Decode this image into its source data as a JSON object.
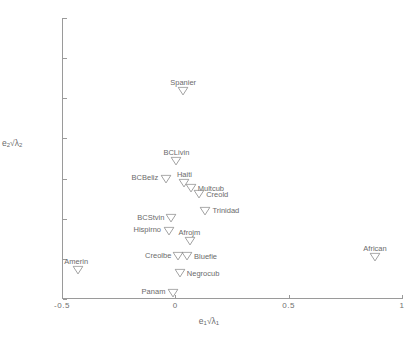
{
  "chart_data": {
    "type": "scatter",
    "title": "",
    "xlabel": "e1 sqrt(lambda1)",
    "ylabel": "e2 sqrt(lambda2)",
    "xlim": [
      -0.5,
      1.0
    ],
    "ylim": [
      -0.4,
      1.0
    ],
    "grid": false,
    "legend": null,
    "marker": "down-triangle-open",
    "xticks": [
      "-0.5",
      "0",
      "0.5",
      "1"
    ],
    "xtick_values": [
      -0.5,
      0,
      0.5,
      1
    ],
    "yticks": [
      "1",
      "0.8",
      "0.6",
      "0.4",
      "0.2",
      "0",
      "-0.2",
      "-0.4"
    ],
    "ytick_values": [
      1,
      0.8,
      0.6,
      0.4,
      0.2,
      0,
      -0.2,
      -0.4
    ],
    "points": [
      {
        "label": "Spanier",
        "x": 0.035,
        "y": 0.635,
        "label_pos": "above"
      },
      {
        "label": "BCLivin",
        "x": 0.005,
        "y": 0.288,
        "label_pos": "above"
      },
      {
        "label": "BCBeliz",
        "x": -0.043,
        "y": 0.198,
        "label_pos": "left"
      },
      {
        "label": "Haiti",
        "x": 0.04,
        "y": 0.178,
        "label_pos": "above"
      },
      {
        "label": "Multcub",
        "x": 0.068,
        "y": 0.152,
        "label_pos": "right"
      },
      {
        "label": "Creold",
        "x": 0.105,
        "y": 0.122,
        "label_pos": "right"
      },
      {
        "label": "Trinidad",
        "x": 0.133,
        "y": 0.04,
        "label_pos": "right"
      },
      {
        "label": "BCStvin",
        "x": -0.018,
        "y": 0.002,
        "label_pos": "left"
      },
      {
        "label": "Hispirno",
        "x": -0.03,
        "y": -0.06,
        "label_pos": "left"
      },
      {
        "label": "Afrojm",
        "x": 0.063,
        "y": -0.11,
        "label_pos": "above"
      },
      {
        "label": "Creolbe",
        "x": 0.012,
        "y": -0.188,
        "label_pos": "left"
      },
      {
        "label": "Bluefie",
        "x": 0.052,
        "y": -0.188,
        "label_pos": "right"
      },
      {
        "label": "African",
        "x": 0.88,
        "y": -0.192,
        "label_pos": "above"
      },
      {
        "label": "Amerin",
        "x": -0.428,
        "y": -0.258,
        "label_pos": "above-left"
      },
      {
        "label": "Negrocub",
        "x": 0.02,
        "y": -0.272,
        "label_pos": "right"
      },
      {
        "label": "Panam",
        "x": -0.012,
        "y": -0.368,
        "label_pos": "left"
      }
    ]
  },
  "axis_titles": {
    "x_base": "e",
    "x_sub": "1",
    "x_radical": "√λ",
    "x_radical_sub": "1",
    "y_base": "e",
    "y_sub": "2",
    "y_radical": "√λ",
    "y_radical_sub": "2"
  },
  "caption": ""
}
